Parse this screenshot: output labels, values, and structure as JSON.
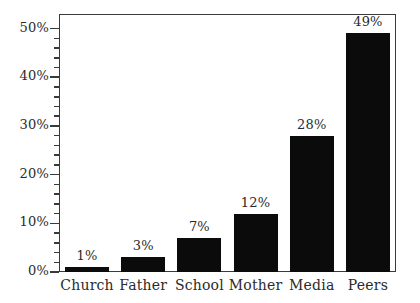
{
  "chart_data": {
    "type": "bar",
    "title": "",
    "subtitle": "",
    "xlabel": "",
    "ylabel": "",
    "categories": [
      "Church",
      "Father",
      "School",
      "Mother",
      "Media",
      "Peers"
    ],
    "values": [
      1,
      3,
      7,
      12,
      28,
      49
    ],
    "value_labels": [
      "1%",
      "3%",
      "7%",
      "12%",
      "28%",
      "49%"
    ],
    "ylim": [
      0,
      53
    ],
    "y_ticks": [
      0,
      10,
      20,
      30,
      40,
      50
    ],
    "y_tick_labels": [
      "0%",
      "10%",
      "20%",
      "30%",
      "40%",
      "50%"
    ],
    "y_minor_tick_step": 2,
    "grid": false,
    "legend": null,
    "bar_color": "#0b0b0b",
    "frame_color": "#3a3a3a",
    "text_color": "#2b2b2b",
    "background": "#ffffff"
  }
}
